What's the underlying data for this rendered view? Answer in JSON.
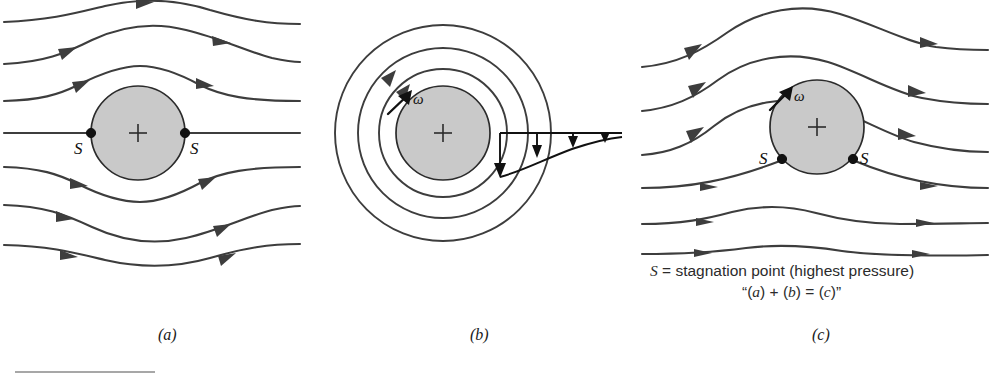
{
  "figure": {
    "background_color": "#ffffff",
    "cylinder_fill": "#c9c9c9",
    "line_color": "#3d3d3d",
    "ink_color": "#111111"
  },
  "panels": [
    {
      "id": "a",
      "label": "(a)",
      "label_x": 158,
      "label_y": 340,
      "description": "Uniform stream past a stationary cylinder",
      "cylinder": {
        "cx": 138,
        "cy": 133,
        "r": 47
      },
      "stagnation_points": [
        {
          "label": "S",
          "x": 91,
          "y": 133,
          "label_x": 74,
          "label_y": 154
        },
        {
          "label": "S",
          "x": 185,
          "y": 133,
          "label_x": 190,
          "label_y": 154
        }
      ],
      "streamline_entry_y": [
        20,
        62,
        100,
        133,
        168,
        205,
        245
      ]
    },
    {
      "id": "b",
      "label": "(b)",
      "label_x": 470,
      "label_y": 340,
      "description": "Pure circulation (vortex) about a rotating cylinder",
      "cylinder": {
        "cx": 443,
        "cy": 133,
        "r": 47
      },
      "circulation_radii": [
        64,
        85,
        108
      ],
      "omega": {
        "symbol": "ω",
        "label_x": 413,
        "label_y": 100
      },
      "velocity_profile": {
        "baseline_y": 133,
        "x_start": 500,
        "x_end": 620,
        "arrow_lengths": [
          40,
          28,
          18,
          11
        ]
      }
    },
    {
      "id": "c",
      "label": "(c)",
      "label_x": 812,
      "label_y": 340,
      "description": "Superposition: uniform stream plus circulation, stagnation points shifted downward",
      "cylinder": {
        "cx": 817,
        "cy": 127,
        "r": 47
      },
      "stagnation_points": [
        {
          "label": "S",
          "x": 782,
          "y": 159,
          "label_x": 762,
          "label_y": 162
        },
        {
          "label": "S",
          "x": 853,
          "y": 159,
          "label_x": 860,
          "label_y": 162
        }
      ],
      "omega": {
        "symbol": "ω",
        "label_x": 795,
        "label_y": 97
      },
      "streamline_entry_y": [
        65,
        110,
        155,
        188,
        222,
        252
      ]
    }
  ],
  "caption": {
    "line1_prefix": "S",
    "line1_rest": " = stagnation point (highest pressure)",
    "line1_x": 650,
    "line1_y": 276,
    "line2_open_quote": "“(",
    "line2_a": "a",
    "line2_plus": ") + (",
    "line2_b": "b",
    "line2_eq": ") = (",
    "line2_c": "c",
    "line2_close": ")”",
    "line2_x": 742,
    "line2_y": 297
  },
  "footnote_rule": {
    "x1": 15,
    "x2": 155,
    "y": 372
  }
}
